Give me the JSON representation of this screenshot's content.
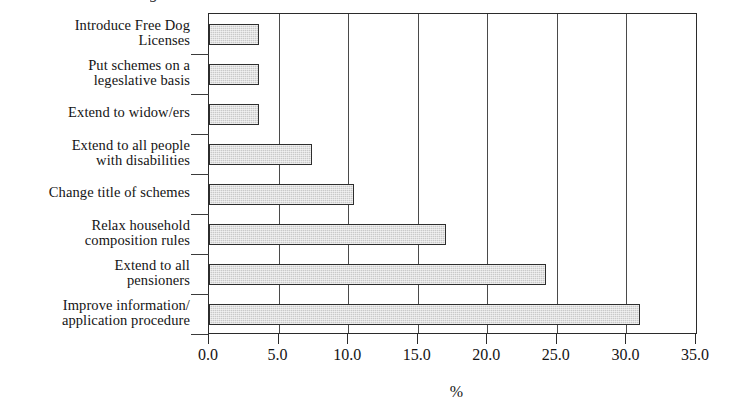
{
  "figure": {
    "title_partial": "g",
    "axis_label_x": "%"
  },
  "chart_data": {
    "type": "bar",
    "orientation": "horizontal",
    "title": "",
    "xlabel": "%",
    "ylabel": "",
    "xlim": [
      0.0,
      35.0
    ],
    "xticks": [
      "0.0",
      "5.0",
      "10.0",
      "15.0",
      "20.0",
      "25.0",
      "30.0",
      "35.0"
    ],
    "xtick_values": [
      0,
      5,
      10,
      15,
      20,
      25,
      30,
      35
    ],
    "grid": "vertical",
    "legend": "none",
    "bar_fill_color": "#c9c9c9",
    "bar_edge_color": "#2e2e2e",
    "categories": [
      "Introduce Free Dog Licenses",
      "Put schemes on a legeslative basis",
      "Extend to widow/ers",
      "Extend to all people with disabilities",
      "Change title of schemes",
      "Relax household composition rules",
      "Extend to all pensioners",
      "Improve information/ application procedure"
    ],
    "category_lines": [
      [
        "Introduce Free Dog",
        "Licenses"
      ],
      [
        "Put schemes on a",
        "legeslative basis"
      ],
      [
        "Extend to widow/ers"
      ],
      [
        "Extend to all people",
        "with disabilities"
      ],
      [
        "Change title of schemes"
      ],
      [
        "Relax household",
        "composition rules"
      ],
      [
        "Extend to all",
        "pensioners"
      ],
      [
        "Improve information/",
        "application procedure"
      ]
    ],
    "values": [
      3.6,
      3.6,
      3.6,
      7.4,
      10.4,
      17.0,
      24.2,
      31.0
    ]
  }
}
